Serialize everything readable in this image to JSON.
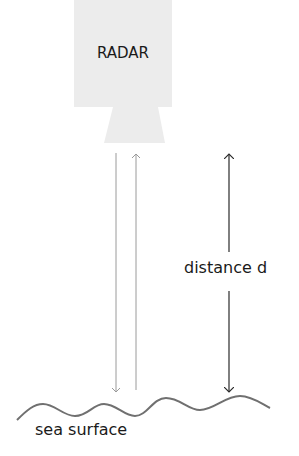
{
  "diagram": {
    "radar": {
      "label": "RADAR",
      "fill": "#ececec"
    },
    "distance_label": "distance d",
    "surface_label": "sea surface",
    "colors": {
      "beam_arrows": "#9a9a9a",
      "distance_arrow": "#2a2a2a",
      "wave": "#707070",
      "text": "#1a1a1a"
    }
  }
}
